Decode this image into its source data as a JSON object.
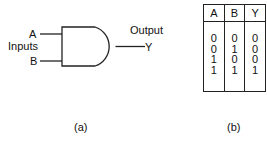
{
  "figure_a": {
    "input_a": "A",
    "input_b": "B",
    "inputs_label": "Inputs",
    "output_label": "Output",
    "output_y": "Y",
    "caption": "(a)"
  },
  "figure_b": {
    "headers": [
      "A",
      "B",
      "Y"
    ],
    "columns": {
      "A": [
        "0",
        "0",
        "1",
        "1"
      ],
      "B": [
        "0",
        "1",
        "0",
        "1"
      ],
      "Y": [
        "0",
        "0",
        "0",
        "1"
      ]
    },
    "caption": "(b)"
  }
}
